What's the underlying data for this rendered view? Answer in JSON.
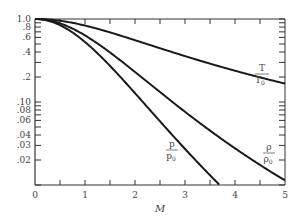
{
  "chart_data": {
    "type": "line",
    "title": "",
    "xlabel": "M",
    "ylabel": "",
    "xlim": [
      0,
      5
    ],
    "ylim": [
      0.01,
      1.0
    ],
    "yscale": "log",
    "grid": false,
    "legend_position": "inline labels at curve ends",
    "x_ticks": [
      "0",
      "1",
      "2",
      "3",
      "4",
      "5"
    ],
    "y_ticks": [
      "1.0",
      ".8",
      ".6",
      ".4",
      ".2",
      ".10",
      ".08",
      ".06",
      ".04",
      ".03",
      ".02"
    ],
    "series": [
      {
        "name": "T/T0",
        "label_num": "T",
        "label_den": "T0",
        "x": [
          0,
          0.5,
          1,
          1.5,
          2,
          2.5,
          3,
          3.5,
          4,
          4.5,
          5
        ],
        "values": [
          1.0,
          0.952,
          0.833,
          0.69,
          0.556,
          0.444,
          0.357,
          0.29,
          0.238,
          0.198,
          0.167
        ]
      },
      {
        "name": "rho/rho0",
        "label_num": "ρ",
        "label_den": "ρ0",
        "x": [
          0,
          0.5,
          1,
          1.5,
          2,
          2.5,
          3,
          3.5,
          4,
          4.5,
          5
        ],
        "values": [
          1.0,
          0.885,
          0.634,
          0.395,
          0.23,
          0.132,
          0.0762,
          0.0452,
          0.0277,
          0.0174,
          0.0113
        ]
      },
      {
        "name": "p/p0",
        "label_num": "p",
        "label_den": "p0",
        "x": [
          0,
          0.5,
          1,
          1.5,
          2,
          2.5,
          3,
          3.5,
          3.7
        ],
        "values": [
          1.0,
          0.843,
          0.528,
          0.272,
          0.128,
          0.0585,
          0.0272,
          0.0131,
          0.01
        ]
      }
    ]
  },
  "axis": {
    "x_title": "M",
    "x_ticks": [
      {
        "label": "0",
        "x": 35
      },
      {
        "label": "1",
        "x": 85
      },
      {
        "label": "2",
        "x": 135
      },
      {
        "label": "3",
        "x": 185
      },
      {
        "label": "4",
        "x": 235
      },
      {
        "label": "5",
        "x": 285
      }
    ],
    "y_ticks": [
      {
        "label": "1.0",
        "v": 1.0
      },
      {
        "label": ".8",
        "v": 0.8
      },
      {
        "label": ".6",
        "v": 0.6
      },
      {
        "label": ".4",
        "v": 0.4
      },
      {
        "label": ".2",
        "v": 0.2
      },
      {
        "label": ".10",
        "v": 0.1
      },
      {
        "label": ".08",
        "v": 0.08
      },
      {
        "label": ".06",
        "v": 0.06
      },
      {
        "label": ".04",
        "v": 0.04
      },
      {
        "label": ".03",
        "v": 0.03
      },
      {
        "label": ".02",
        "v": 0.02
      }
    ]
  },
  "labels": {
    "T_num": "T",
    "T_den": "T",
    "T_sub": "0",
    "rho_num": "ρ",
    "rho_den": "ρ",
    "rho_sub": "0",
    "p_num": "p",
    "p_den": "p",
    "p_sub": "0"
  },
  "colors": {
    "curve": "#1a1a1a",
    "axis": "#333333",
    "text": "#444444"
  }
}
